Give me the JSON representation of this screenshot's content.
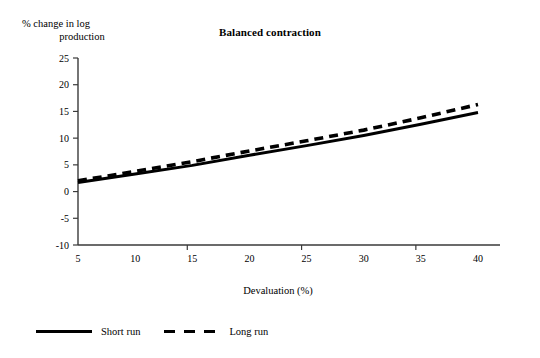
{
  "chart_data": {
    "type": "line",
    "title": "Balanced contraction",
    "xlabel": "Devaluation (%)",
    "ylabel": "% change in log production",
    "ylabel_lines": [
      "% change in log",
      "production"
    ],
    "x": [
      5,
      10,
      15,
      20,
      25,
      30,
      35,
      40
    ],
    "xticklabels": [
      "5",
      "10",
      "15",
      "20",
      "25",
      "30",
      "35",
      "40"
    ],
    "yticklabels": [
      "25",
      "20",
      "15",
      "10",
      "5",
      "0",
      "-5",
      "-10"
    ],
    "yticks": [
      25,
      20,
      15,
      10,
      5,
      0,
      -5,
      -10
    ],
    "xlim": [
      5,
      40
    ],
    "ylim": [
      -10,
      25
    ],
    "grid": false,
    "legend_position": "below-plot-left",
    "series": [
      {
        "name": "Short run",
        "style": "solid",
        "color": "#000000",
        "values": [
          1.7,
          3.3,
          4.9,
          6.8,
          8.6,
          10.5,
          12.6,
          14.8
        ]
      },
      {
        "name": "Long run",
        "style": "dashed",
        "color": "#000000",
        "values": [
          2.0,
          3.8,
          5.6,
          7.6,
          9.5,
          11.5,
          13.8,
          16.3
        ]
      }
    ]
  },
  "legend": {
    "items": [
      {
        "label": "Short run",
        "style": "solid"
      },
      {
        "label": "Long run",
        "style": "dashed"
      }
    ]
  }
}
